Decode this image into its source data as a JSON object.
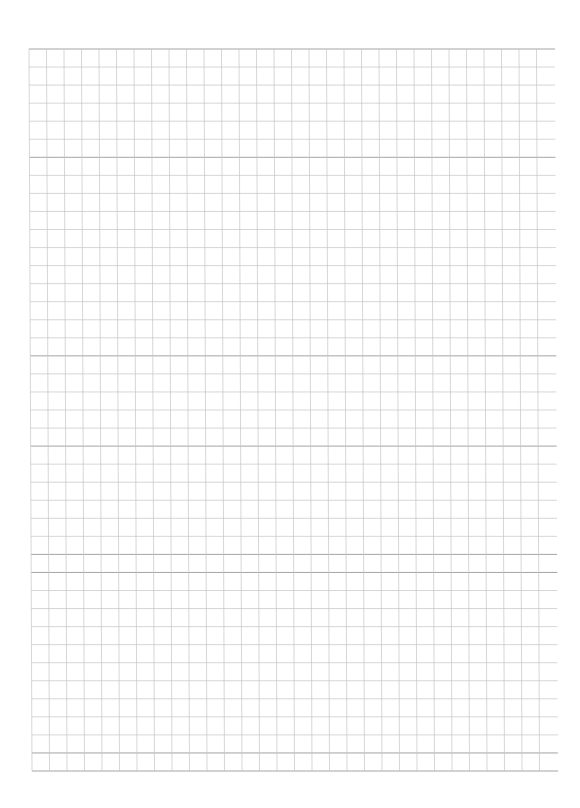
{
  "page": {
    "type": "grid-paper",
    "background": "#ffffff"
  },
  "grid": {
    "origin_x": 29,
    "origin_y": 49,
    "cell_width": 17.5,
    "cell_height": 18.05,
    "columns": 29,
    "rows": 40,
    "horizontal_line_start_x": 29,
    "horizontal_line_end_x": 555,
    "vertical_line_end_y": 770,
    "skew_x_bottom_offset": 3,
    "line_color": "#c4c4c4",
    "emphasis_line_color": "#9a9a9a",
    "emphasized_rows": [
      0,
      6,
      17,
      22,
      28,
      29,
      39,
      40
    ]
  }
}
